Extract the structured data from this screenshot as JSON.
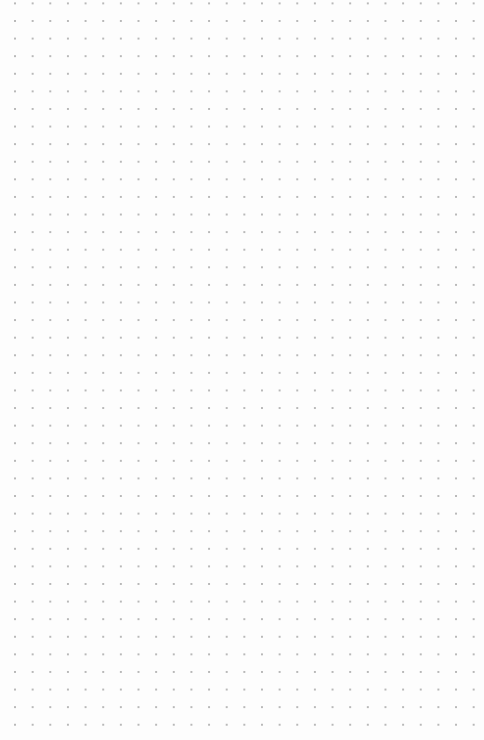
{
  "canvas": {
    "type": "dot-grid",
    "width": 484,
    "height": 740,
    "background_color": "#fdfdfd",
    "dot_color": "#b8b8b8",
    "grid_spacing_x": 17.65,
    "grid_spacing_y": 17.6,
    "columns": 26,
    "rows": 41
  }
}
